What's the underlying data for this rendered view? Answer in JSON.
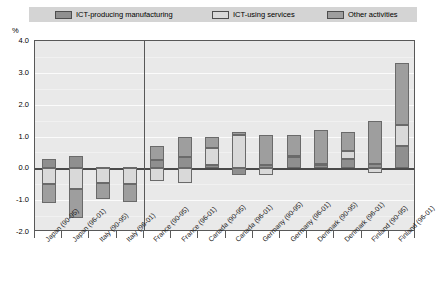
{
  "legend": {
    "items": [
      {
        "label": "ICT-producing manufacturing",
        "color": "#8f8f8f",
        "key": "mfg"
      },
      {
        "label": "ICT-using services",
        "color": "#d9d9d9",
        "key": "svc"
      },
      {
        "label": "Other activities",
        "color": "#9e9e9e",
        "key": "oth"
      }
    ]
  },
  "axis": {
    "unit_label": "%",
    "yticks": [
      "4.0",
      "3.0",
      "2.0",
      "1.0",
      "0.0",
      "-1.0",
      "-2.0"
    ],
    "ytick_values": [
      4.0,
      3.0,
      2.0,
      1.0,
      0.0,
      -1.0,
      -2.0
    ]
  },
  "chart_data": {
    "type": "bar",
    "title": "",
    "subtitle": "",
    "xlabel": "",
    "ylabel": "%",
    "ylim": [
      -2.0,
      4.0
    ],
    "ytick_step": 1.0,
    "grid": true,
    "stacked": true,
    "legend_position": "top",
    "divider_after_category_index": 3,
    "categories": [
      "Japan (90-95)",
      "Japan (96-01)",
      "Italy (90-95)",
      "Italy (96-01)",
      "France (90-95)",
      "France (96-01)",
      "Canada (90-95)",
      "Canada (96-01)",
      "Germany (90-95)",
      "Germany (96-01)",
      "Denmark (90-95)",
      "Denmark (96-01)",
      "Finland (90-95)",
      "Finland (96-01)"
    ],
    "series": [
      {
        "name": "ICT-producing manufacturing",
        "color": "#8f8f8f",
        "values": [
          0.3,
          0.4,
          0.05,
          0.05,
          0.25,
          0.35,
          0.1,
          -0.2,
          0.1,
          0.35,
          0.1,
          0.3,
          0.15,
          0.7
        ]
      },
      {
        "name": "ICT-using services",
        "color": "#d9d9d9",
        "values": [
          -0.5,
          -0.65,
          -0.45,
          -0.5,
          -0.4,
          -0.45,
          0.55,
          1.05,
          -0.2,
          0.05,
          0.05,
          0.25,
          -0.15,
          0.65
        ]
      },
      {
        "name": "Other activities",
        "color": "#9e9e9e",
        "values": [
          -0.6,
          -0.9,
          -0.5,
          -0.55,
          0.45,
          0.65,
          0.35,
          0.1,
          0.95,
          0.65,
          1.05,
          0.6,
          1.35,
          1.95
        ]
      }
    ],
    "totals": [
      -0.8,
      -1.15,
      -0.9,
      -1.0,
      0.3,
      0.55,
      1.0,
      0.95,
      0.85,
      1.05,
      1.2,
      1.15,
      1.35,
      3.3
    ]
  }
}
